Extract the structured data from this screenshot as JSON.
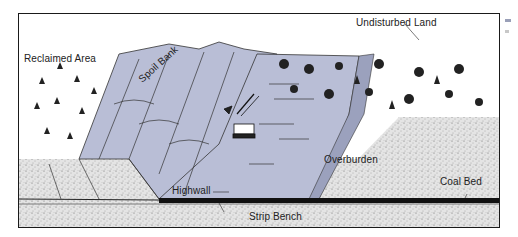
{
  "figure": {
    "colors": {
      "pit_fill": "#b9bed6",
      "ground_stipple": "#d9d9d9",
      "coal_bed": "#111111",
      "frame": "#1a1a1a"
    },
    "labels": {
      "reclaimed_area": "Reclaimed Area",
      "spoil_bank": "Spoil Bank",
      "undisturbed_land": "Undisturbed Land",
      "highwall": "Highwall",
      "overburden": "Overburden",
      "coal_bed": "Coal Bed",
      "strip_bench": "Strip Bench"
    },
    "icons": [
      "excavator-icon",
      "tree-icon"
    ]
  }
}
